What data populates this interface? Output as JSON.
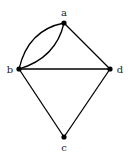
{
  "diagram": {
    "type": "graph",
    "directed": false,
    "colors": {
      "edge": "#000000",
      "node": "#000000",
      "label": "#222222",
      "background": "#ffffff"
    },
    "nodes": [
      {
        "id": "a",
        "label": "a"
      },
      {
        "id": "b",
        "label": "b"
      },
      {
        "id": "c",
        "label": "c"
      },
      {
        "id": "d",
        "label": "d"
      }
    ],
    "edges": [
      {
        "from": "a",
        "to": "b",
        "style": "curved-outer"
      },
      {
        "from": "a",
        "to": "b",
        "style": "curved-inner"
      },
      {
        "from": "a",
        "to": "d",
        "style": "straight"
      },
      {
        "from": "b",
        "to": "d",
        "style": "straight"
      },
      {
        "from": "b",
        "to": "c",
        "style": "straight"
      },
      {
        "from": "d",
        "to": "c",
        "style": "straight"
      }
    ]
  }
}
